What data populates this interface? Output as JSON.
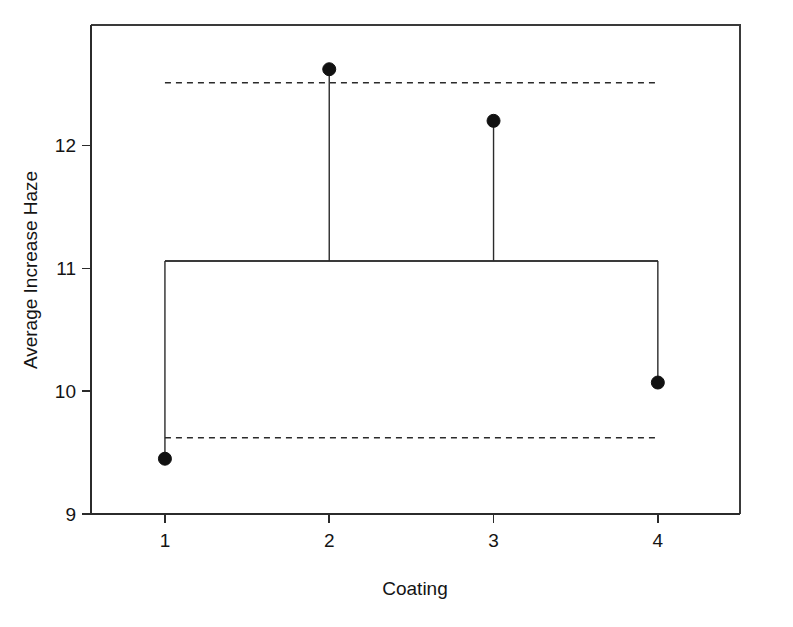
{
  "chart_data": {
    "type": "scatter",
    "title": "",
    "xlabel": "Coating",
    "ylabel": "Average Increase Haze",
    "categories": [
      "1",
      "2",
      "3",
      "4"
    ],
    "x": [
      1,
      2,
      3,
      4
    ],
    "values": [
      9.45,
      12.62,
      12.2,
      10.07
    ],
    "series": [
      {
        "name": "Average Increase Haze",
        "values": [
          9.45,
          12.62,
          12.2,
          10.07
        ]
      }
    ],
    "xlim": [
      0.55,
      4.5
    ],
    "ylim": [
      9,
      12.98
    ],
    "xticks": [
      1,
      2,
      3,
      4
    ],
    "xtick_labels": [
      "1",
      "2",
      "3",
      "4"
    ],
    "yticks": [
      9,
      10,
      11,
      12
    ],
    "ytick_labels": [
      "9",
      "10",
      "11",
      "12"
    ],
    "grid": false,
    "legend": "none",
    "reference_lines": [
      {
        "name": "upper-control-limit",
        "value": 12.51,
        "style": "dashed"
      },
      {
        "name": "center-line",
        "value": 11.06,
        "style": "solid"
      },
      {
        "name": "lower-control-limit",
        "value": 9.62,
        "style": "dashed"
      }
    ],
    "marker": "filled-circle",
    "stem_baseline": 11.06,
    "colors": {
      "marker": "#111111",
      "line": "#2b2b2b",
      "axis": "#2b2b2b",
      "background": "#ffffff"
    }
  },
  "axes": {
    "y_title": "Average Increase Haze",
    "x_title": "Coating"
  }
}
